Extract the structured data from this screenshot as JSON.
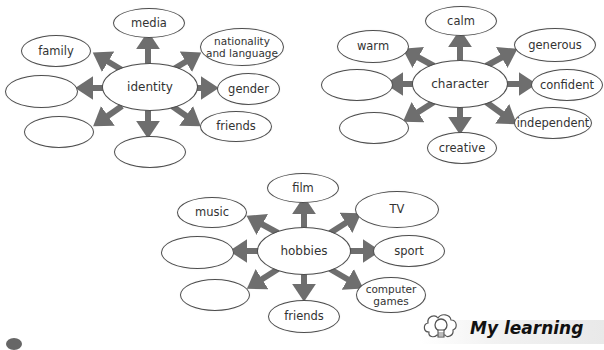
{
  "diagrams": {
    "identity": {
      "center": "identity",
      "nodes": {
        "top": "media",
        "top_right": "nationality\nand language",
        "right": "gender",
        "bottom_right": "friends",
        "bottom": "",
        "bottom_left": "",
        "left": "",
        "top_left": "family"
      }
    },
    "character": {
      "center": "character",
      "nodes": {
        "top": "calm",
        "top_right": "generous",
        "right": "confident",
        "bottom_right": "independent",
        "bottom": "creative",
        "bottom_left": "",
        "left": "",
        "top_left": "warm"
      }
    },
    "hobbies": {
      "center": "hobbies",
      "nodes": {
        "top": "film",
        "top_right": "TV",
        "right": "sport",
        "bottom_right": "computer\ngames",
        "bottom": "friends",
        "bottom_left": "",
        "left": "",
        "top_left": "music"
      }
    }
  },
  "footer": {
    "title": "My learning",
    "icon": "lightbulb-icon"
  },
  "colors": {
    "arrow": "#6e6e6e",
    "oval_border": "#4d4d4d",
    "text": "#333333"
  }
}
